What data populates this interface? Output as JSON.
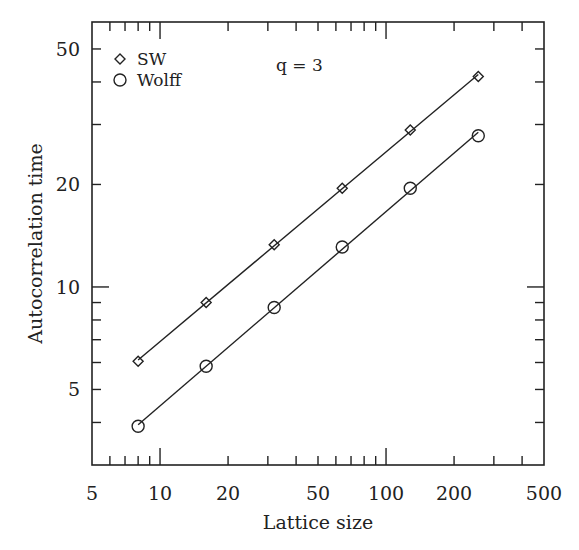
{
  "chart_data": {
    "type": "line",
    "title": "",
    "annotation": "q = 3",
    "xlabel": "Lattice size",
    "ylabel": "Autocorrelation time",
    "xscale": "log",
    "yscale": "log",
    "xlim": [
      5,
      500
    ],
    "ylim": [
      3,
      60
    ],
    "xticks": [
      5,
      10,
      20,
      50,
      100,
      200,
      500
    ],
    "xtick_labels": [
      "5",
      "10",
      "20",
      "50",
      "100",
      "200",
      "500"
    ],
    "yticks": [
      5,
      10,
      20,
      50
    ],
    "ytick_labels": [
      "5",
      "10",
      "20",
      "50"
    ],
    "grid": false,
    "legend_position": "upper-left",
    "x": [
      8,
      16,
      32,
      64,
      128,
      256
    ],
    "series": [
      {
        "name": "SW",
        "marker": "diamond",
        "values": [
          6.05,
          9.0,
          13.3,
          19.5,
          28.9,
          41.5
        ],
        "fit_line": true
      },
      {
        "name": "Wolff",
        "marker": "circle",
        "values": [
          3.9,
          5.85,
          8.7,
          13.1,
          19.5,
          27.8
        ],
        "fit_line": true
      }
    ]
  },
  "frame": {
    "left": 92,
    "top": 22,
    "right": 544,
    "bottom": 465
  },
  "colors": {
    "ink": "#222222",
    "background": "#ffffff"
  }
}
